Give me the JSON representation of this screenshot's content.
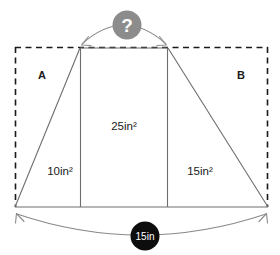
{
  "figure": {
    "regions": {
      "left_corner_label": "A",
      "right_corner_label": "B"
    },
    "area_labels": {
      "left_triangle": "10in²",
      "center_rectangle": "25in²",
      "right_triangle": "15in²"
    },
    "badges": {
      "unknown": {
        "text": "?",
        "fill": "#8c8c8c",
        "text_color": "#ffffff"
      },
      "base_dimension": {
        "text": "15in",
        "fill": "#0d0d0d",
        "text_color": "#ffffff"
      }
    },
    "colors": {
      "solid_stroke": "#6e6e6e",
      "dashed_stroke": "#1a1a1a",
      "dimension_stroke": "#8a8a8a",
      "background": "#ffffff",
      "label_text": "#1a1a1a"
    },
    "geometry": {
      "bounding_box": {
        "x1": 15,
        "y1": 47,
        "x2": 268,
        "y2": 207
      },
      "trapezoid_top_left": {
        "x": 80,
        "y": 48
      },
      "trapezoid_top_right": {
        "x": 168,
        "y": 48
      },
      "trapezoid_bottom_left": {
        "x": 15,
        "y": 207
      },
      "trapezoid_bottom_right": {
        "x": 268,
        "y": 207
      },
      "divider_left_x": 80,
      "divider_right_x": 168
    }
  }
}
